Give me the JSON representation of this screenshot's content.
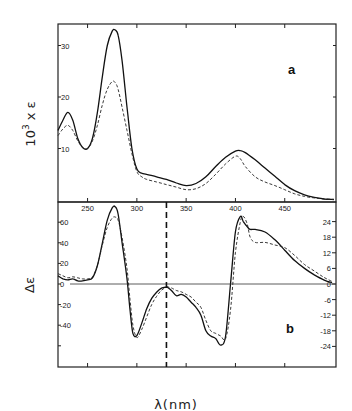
{
  "chart_data": [
    {
      "panel": "a",
      "type": "line",
      "title": "",
      "panel_label": "a",
      "xlabel": "λ(nm)",
      "ylabel": "10³ x ε",
      "xlim": [
        220,
        502
      ],
      "ylim": [
        0,
        34
      ],
      "x_ticks": [
        250,
        300,
        350,
        400,
        450
      ],
      "y_ticks": [
        10,
        20,
        30
      ],
      "grid": false,
      "legend": null,
      "series": [
        {
          "name": "solid",
          "style": "solid",
          "x": [
            220,
            225,
            230,
            235,
            240,
            245,
            250,
            255,
            260,
            265,
            270,
            275,
            278,
            281,
            285,
            290,
            295,
            300,
            305,
            310,
            320,
            330,
            340,
            350,
            360,
            370,
            380,
            390,
            400,
            405,
            410,
            420,
            430,
            440,
            450,
            460,
            470,
            480,
            490,
            500
          ],
          "y": [
            13.5,
            15.5,
            17.0,
            15.5,
            12.0,
            10.2,
            10.0,
            12.0,
            17.0,
            24.0,
            30.0,
            32.8,
            33.0,
            32.0,
            27.0,
            18.0,
            10.0,
            6.0,
            5.2,
            5.0,
            4.5,
            4.0,
            3.3,
            2.8,
            3.2,
            4.5,
            6.5,
            8.3,
            9.5,
            9.6,
            9.2,
            7.8,
            6.2,
            4.6,
            3.0,
            1.8,
            1.0,
            0.5,
            0.2,
            0.1
          ]
        },
        {
          "name": "dashed",
          "style": "dashed",
          "x": [
            220,
            225,
            230,
            235,
            240,
            245,
            250,
            255,
            260,
            265,
            270,
            275,
            278,
            281,
            285,
            290,
            295,
            300,
            305,
            310,
            320,
            330,
            340,
            350,
            360,
            370,
            380,
            390,
            400,
            405,
            410,
            420,
            430,
            440,
            450,
            460,
            470,
            480,
            490,
            500
          ],
          "y": [
            12.5,
            13.8,
            14.5,
            13.5,
            11.5,
            10.2,
            10.0,
            11.5,
            14.5,
            18.5,
            21.5,
            23.0,
            22.8,
            21.5,
            18.0,
            13.5,
            9.0,
            5.5,
            4.5,
            4.0,
            3.5,
            3.0,
            2.5,
            2.0,
            2.2,
            3.2,
            5.0,
            7.0,
            8.5,
            8.0,
            6.5,
            4.5,
            3.5,
            2.8,
            2.0,
            1.2,
            0.7,
            0.4,
            0.2,
            0.1
          ]
        }
      ]
    },
    {
      "panel": "b",
      "type": "line",
      "title": "",
      "panel_label": "b",
      "xlabel": "λ(nm)",
      "ylabel": "Δε",
      "xlim": [
        220,
        502
      ],
      "ylim_left": [
        -80,
        80
      ],
      "ylim_right": [
        -30,
        30
      ],
      "x_ticks": [
        250,
        300,
        350,
        400,
        450
      ],
      "y_ticks_left": [
        60,
        40,
        20,
        0,
        -20,
        -40,
        -60
      ],
      "y_tick_labels_left": [
        "60",
        "40",
        "20",
        "0",
        "-20",
        "-40",
        ""
      ],
      "y_ticks_right": [
        24,
        18,
        12,
        6,
        0,
        -6,
        -12,
        -18,
        -24
      ],
      "y_tick_labels_right": [
        "24",
        "18",
        "12",
        "6",
        "0",
        "-6",
        "-12",
        "-18",
        "-24"
      ],
      "zero_line": true,
      "vertical_marker_nm": 330,
      "grid": false,
      "legend": null,
      "series": [
        {
          "name": "solid",
          "style": "solid",
          "axis": "left (λ<330), right (λ>330)",
          "x": [
            220,
            225,
            230,
            235,
            240,
            245,
            250,
            255,
            260,
            265,
            270,
            275,
            278,
            281,
            285,
            290,
            293,
            296,
            300,
            305,
            310,
            315,
            320,
            325,
            330
          ],
          "y": [
            8,
            5,
            4,
            5,
            3,
            3,
            4,
            6,
            18,
            40,
            62,
            74,
            75,
            68,
            40,
            5,
            -25,
            -48,
            -50,
            -38,
            -24,
            -14,
            -8,
            -4,
            -3
          ]
        },
        {
          "name": "dashed",
          "style": "dashed",
          "axis": "left (λ<330), right (λ>330)",
          "x": [
            220,
            225,
            230,
            235,
            240,
            245,
            250,
            255,
            260,
            265,
            270,
            275,
            278,
            281,
            285,
            290,
            293,
            296,
            300,
            305,
            310,
            315,
            320,
            325,
            330
          ],
          "y": [
            10,
            8,
            6,
            7,
            6,
            5,
            5,
            7,
            18,
            38,
            55,
            64,
            65,
            62,
            45,
            15,
            -15,
            -40,
            -52,
            -44,
            -32,
            -20,
            -12,
            -6,
            -3
          ]
        },
        {
          "name": "solid (right axis)",
          "style": "solid",
          "x": [
            330,
            335,
            340,
            345,
            350,
            355,
            360,
            365,
            370,
            375,
            380,
            385,
            390,
            395,
            400,
            405,
            408,
            412,
            415,
            420,
            430,
            440,
            450,
            460,
            470,
            480,
            490,
            498
          ],
          "y": [
            -1,
            -2.5,
            -4.5,
            -4,
            -5,
            -7,
            -9,
            -12,
            -18,
            -20,
            -21,
            -23.5,
            -20,
            0,
            20,
            26,
            24,
            22,
            21,
            21,
            20,
            17,
            13,
            9,
            6,
            3.5,
            1.5,
            0.5
          ]
        },
        {
          "name": "dashed (right axis)",
          "style": "dashed",
          "x": [
            330,
            335,
            340,
            345,
            350,
            355,
            360,
            365,
            370,
            375,
            380,
            385,
            390,
            395,
            400,
            405,
            408,
            412,
            415,
            420,
            430,
            440,
            450,
            460,
            470,
            480,
            490,
            498
          ],
          "y": [
            -1,
            -1.5,
            -2.5,
            -3,
            -4,
            -5,
            -7,
            -9,
            -14,
            -18,
            -19,
            -20,
            -21,
            -10,
            12,
            24,
            26,
            23,
            18,
            16,
            16,
            15,
            14,
            11,
            7.5,
            5,
            2.5,
            1
          ]
        }
      ]
    }
  ],
  "labels": {
    "ylabel_a": "10³ x ε",
    "ylabel_a_base": "10",
    "ylabel_a_exp": "3",
    "ylabel_a_rest": " x ε",
    "ylabel_b": "Δε",
    "xlabel": "λ(nm)",
    "panel_a": "a",
    "panel_b": "b"
  }
}
